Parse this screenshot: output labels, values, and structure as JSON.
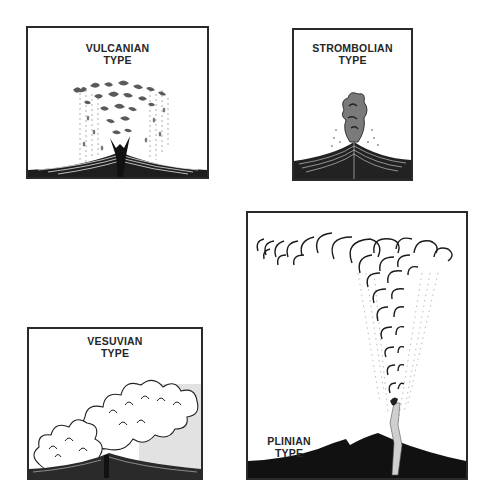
{
  "figure": {
    "panels": [
      {
        "id": "vulcanian",
        "title_line1": "VULCANIAN",
        "title_line2": "TYPE"
      },
      {
        "id": "strombolian",
        "title_line1": "STROMBOLIAN",
        "title_line2": "TYPE"
      },
      {
        "id": "vesuvian",
        "title_line1": "VESUVIAN",
        "title_line2": "TYPE"
      },
      {
        "id": "plinian",
        "title_line1": "PLINIAN",
        "title_line2": "TYPE"
      }
    ],
    "colors": {
      "ink": "#262626",
      "border": "#2a2a2a",
      "background": "#ffffff",
      "ash": "#6a6a6a"
    }
  }
}
